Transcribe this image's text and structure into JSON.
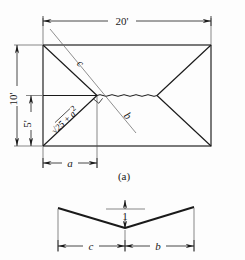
{
  "figure": {
    "caption_a": "(a)",
    "top_dimension": "20'",
    "left_dimension_full": "10'",
    "left_dimension_half": "5'",
    "bottom_dimension": "a",
    "diagonal_upper_label": "c",
    "diagonal_lower_label": "b",
    "hypotenuse_label_prefix": "√",
    "hypotenuse_label_body": "25 + a",
    "hypotenuse_label_exponent": "2",
    "hypotenuse_label_full": "√25 + a²"
  },
  "cross_section": {
    "height_dimension": "1",
    "left_dimension": "c",
    "right_dimension": "b"
  },
  "style": {
    "ink": "#1a1a1a",
    "thin_ink": "#555555",
    "background": "#fdfdfd"
  }
}
